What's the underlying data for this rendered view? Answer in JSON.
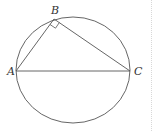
{
  "diagram": {
    "title": "",
    "circle": {
      "cx": 73,
      "cy": 70,
      "rx": 57,
      "ry": 53,
      "stroke": "#555555"
    },
    "points": {
      "A": {
        "label": "A",
        "x": 16,
        "y": 71
      },
      "B": {
        "label": "B",
        "x": 54,
        "y": 19
      },
      "C": {
        "label": "C",
        "x": 130,
        "y": 71
      }
    },
    "segments": [
      "AB",
      "BC",
      "AC"
    ],
    "right_angle_at": "B",
    "colors": {
      "line": "#555555",
      "label": "#333333"
    }
  },
  "labels": {
    "A": "A",
    "B": "B",
    "C": "C"
  }
}
